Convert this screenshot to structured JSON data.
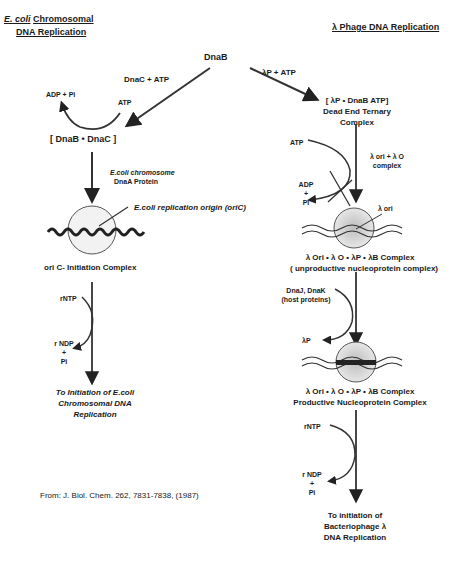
{
  "headers": {
    "left_italic": "E. coli",
    "left_rest": "Chromosomal",
    "left_line2": "DNA Replication",
    "right": "λ Phage DNA Replication"
  },
  "top": {
    "dnab": "DnaB",
    "dnac_atp": "DnaC + ATP",
    "lambdap_atp": "λP + ATP"
  },
  "left_branch": {
    "adp_pi": "ADP + Pi",
    "atp": "ATP",
    "complex": "[ DnaB • DnaC ]",
    "dnaa_line1": "E.coli chromosome",
    "dnaa_line2": "DnaA Protein",
    "origin_label": "E.coli replication origin (oriC)",
    "initiation_complex": "ori C- Initiation Complex",
    "rntp": "rNTP",
    "rndp": "r NDP",
    "plus": "+",
    "pi": "Pi",
    "final_line1": "To Initiation of E.coli",
    "final_line2": "Chromosomal DNA",
    "final_line3": "Replication"
  },
  "right_branch": {
    "ternary_line1": "[ λP • DnaB  ATP]",
    "ternary_line2": "Dead End Ternary",
    "ternary_line3": "Complex",
    "atp": "ATP",
    "adp": "ADP",
    "plus": "+",
    "pi": "Pi",
    "lori_line1": "λ ori + λ O",
    "lori_line2": "complex",
    "lambda_ori": "λ ori",
    "unprod_line1": "λ Ori • λ O • λP • λB  Complex",
    "unprod_line2": "( unproductive nucleoprotein complex)",
    "dnajk_line1": "DnaJ, DnaK",
    "dnajk_line2": "(host proteins)",
    "lambdap": "λP",
    "prod_line1": "λ Ori • λ O • λP • λB Complex",
    "prod_line2": "Productive Nucleoprotein Complex",
    "rntp": "rNTP",
    "rndp": "r NDP",
    "final_line1": "To initiation of",
    "final_line2": "Bacteriophage λ",
    "final_line3": "DNA Replication"
  },
  "citation": "From:  J. Biol. Chem. 262, 7831-7838, (1987)"
}
